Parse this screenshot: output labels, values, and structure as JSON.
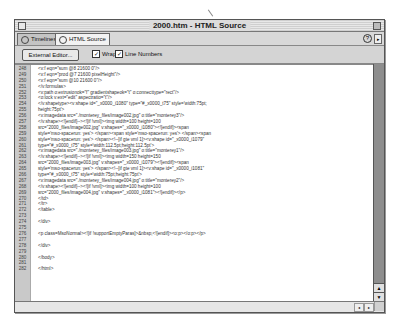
{
  "window": {
    "title": "2000.htm - HTML Source"
  },
  "tabs": [
    {
      "label": "Timelines",
      "icon": "clock-icon",
      "active": false
    },
    {
      "label": "HTML Source",
      "icon": "code-brackets-icon",
      "active": true
    }
  ],
  "tabrow_icons": {
    "help": "?",
    "menu": "▸"
  },
  "toolbar": {
    "external_editor_label": "External Editor...",
    "wrap_label": "Wrap",
    "wrap_checked": true,
    "line_numbers_label": "Line Numbers",
    "line_numbers_checked": true
  },
  "code_lines": [
    {
      "n": "248",
      "text": "<v:f eqn=\"sum @8 21600 0\"/>"
    },
    {
      "n": "249",
      "text": "<v:f eqn=\"prod @7 21600 pixelHeight\"/>"
    },
    {
      "n": "250",
      "text": "<v:f eqn=\"sum @10 21600 0\"/>"
    },
    {
      "n": "251",
      "text": "</v:formulas>"
    },
    {
      "n": "252",
      "text": "<v:path o:extrusionok=\"f\" gradientshapeok=\"t\" o:connecttype=\"rect\"/>"
    },
    {
      "n": "253",
      "text": "<o:lock v:ext=\"edit\" aspectratio=\"t\"/>"
    },
    {
      "n": "254",
      "text": "</v:shapetype><v:shape id=\"_x0000_i1080\" type=\"#_x0000_t75\" style='width:75pt;"
    },
    {
      "n": "255",
      "text": "height:75pt'>"
    },
    {
      "n": "256",
      "text": "<v:imagedata src=\"./monterey_files/image002.jpg\" o:title=\"monterey3\"/>"
    },
    {
      "n": "257",
      "text": "</v:shape><![endif]--><![if !vml]><img width=100 height=100"
    },
    {
      "n": "258",
      "text": "src=\"2000_files/image002.jpg\" v:shapes=\"_x0000_i1080\"><![endif]><span"
    },
    {
      "n": "259",
      "text": "style='mso-spacerun: yes'> </span><span style='mso-spacerun: yes'> </span><span"
    },
    {
      "n": "260",
      "text": "style='mso-spacerun: yes'> </span><!--[if gte vml 1]><v:shape id=\"_x0000_i1079\""
    },
    {
      "n": "261",
      "text": "type=\"#_x0000_t75\" style='width:112.5pt;height:112.5pt'>"
    },
    {
      "n": "262",
      "text": "<v:imagedata src=\"./monterey_files/image003.jpg\" o:title=\"monterey1\"/>"
    },
    {
      "n": "263",
      "text": "</v:shape><![endif]--><![if !vml]><img width=150 height=150"
    },
    {
      "n": "264",
      "text": "src=\"2000_files/image003.jpg\" v:shapes=\"_x0000_i1079\"><![endif]><span"
    },
    {
      "n": "265",
      "text": "style='mso-spacerun: yes'>          </span><!--[if gte vml 1]><v:shape id=\"_x0000_i1081\""
    },
    {
      "n": "266",
      "text": "type=\"#_x0000_t75\" style='width:75pt;height:75pt'>"
    },
    {
      "n": "267",
      "text": "<v:imagedata src=\"./monterey_files/image004.jpg\" o:title=\"monterey2\"/>"
    },
    {
      "n": "268",
      "text": "</v:shape><![endif]--><![if !vml]><img width=100 height=100"
    },
    {
      "n": "269",
      "text": "src=\"2000_files/image004.jpg\" v:shapes=\"_x0000_i1081\"><![endif]></p>"
    },
    {
      "n": "270",
      "text": "</td>"
    },
    {
      "n": "271",
      "text": "</tr>"
    },
    {
      "n": "272",
      "text": "</table>"
    },
    {
      "n": "273",
      "text": ""
    },
    {
      "n": "274",
      "text": "</div>"
    },
    {
      "n": "275",
      "text": ""
    },
    {
      "n": "276",
      "text": "<p class=MsoNormal><![if !supportEmptyParas]>&nbsp;<![endif]><o:p></o:p></p>"
    },
    {
      "n": "277",
      "text": ""
    },
    {
      "n": "278",
      "text": "</div>"
    },
    {
      "n": "279",
      "text": ""
    },
    {
      "n": "280",
      "text": "</body>"
    },
    {
      "n": "281",
      "text": ""
    },
    {
      "n": "282",
      "text": "</html>"
    }
  ],
  "scrollbar": {
    "up_arrow": "▲",
    "down_arrow": "▼",
    "left_arrow": "◂",
    "right_arrow": "▸"
  }
}
